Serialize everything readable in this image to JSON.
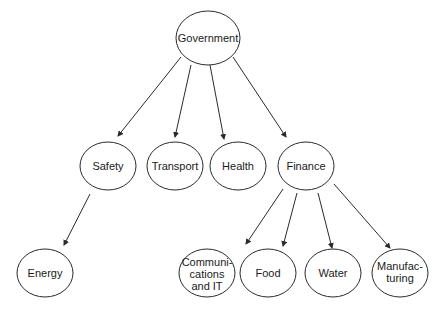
{
  "diagram": {
    "type": "hierarchy",
    "nodes": {
      "government": {
        "label": "Government",
        "lines": [
          "Government"
        ]
      },
      "safety": {
        "label": "Safety",
        "lines": [
          "Safety"
        ]
      },
      "transport": {
        "label": "Transport",
        "lines": [
          "Transport"
        ]
      },
      "health": {
        "label": "Health",
        "lines": [
          "Health"
        ]
      },
      "finance": {
        "label": "Finance",
        "lines": [
          "Finance"
        ]
      },
      "energy": {
        "label": "Energy",
        "lines": [
          "Energy"
        ]
      },
      "communications": {
        "label": "Communications and IT",
        "lines": [
          "Communi-",
          "cations",
          "and IT"
        ]
      },
      "food": {
        "label": "Food",
        "lines": [
          "Food"
        ]
      },
      "water": {
        "label": "Water",
        "lines": [
          "Water"
        ]
      },
      "manufacturing": {
        "label": "Manufacturing",
        "lines": [
          "Manufac-",
          "turing"
        ]
      }
    },
    "edges": [
      {
        "from": "Government",
        "to": "Safety"
      },
      {
        "from": "Government",
        "to": "Transport"
      },
      {
        "from": "Government",
        "to": "Health"
      },
      {
        "from": "Government",
        "to": "Finance"
      },
      {
        "from": "Safety",
        "to": "Energy"
      },
      {
        "from": "Finance",
        "to": "Communications and IT"
      },
      {
        "from": "Finance",
        "to": "Food"
      },
      {
        "from": "Finance",
        "to": "Water"
      },
      {
        "from": "Finance",
        "to": "Manufacturing"
      }
    ],
    "colors": {
      "stroke": "#2b2b2b",
      "text": "#1a1a1a",
      "background": "#ffffff"
    }
  }
}
